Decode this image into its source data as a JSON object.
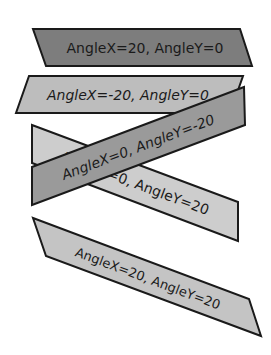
{
  "shapes": [
    {
      "label": "AngleX=20, AngleY=0",
      "fill": "#7d7d7d",
      "points": "33,29 240,29 252,66 46,66",
      "text_x": 145,
      "text_y": 53,
      "rotate": 0,
      "italic": false,
      "font_size": 14
    },
    {
      "label": "AngleX=-20, AngleY=0",
      "fill": "#bdbdbd",
      "points": "29,76 243,76 230,113 16,113",
      "text_x": 128,
      "text_y": 100,
      "rotate": 0,
      "italic": true,
      "font_size": 14
    },
    {
      "label": "AngleX=0, AngleY=20",
      "fill": "#cdcdcd",
      "points": "32,125 238,202 238,241 32,163",
      "text_x": 135,
      "text_y": 188,
      "rotate": 20.5,
      "italic": false,
      "font_size": 14
    },
    {
      "label": "AngleX=0, AngleY=-20",
      "fill": "#9a9a9a",
      "points": "32,167 244,87 245,125 32,205",
      "text_x": 138,
      "text_y": 152,
      "rotate": -20.5,
      "italic": true,
      "font_size": 14
    },
    {
      "label": "AngleX=20, AngleY=20",
      "fill": "#c4c4c4",
      "points": "33,218 249,299 261,336 46,256",
      "text_x": 148,
      "text_y": 283,
      "rotate": 20.5,
      "italic": false,
      "font_size": 13
    }
  ]
}
